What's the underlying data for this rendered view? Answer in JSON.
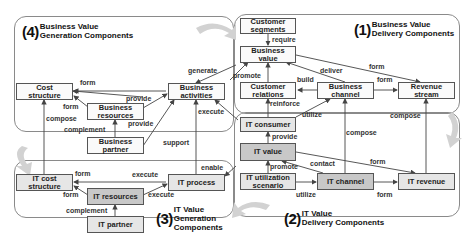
{
  "panels": {
    "p4": {
      "num": "(4)",
      "line1": "Business Value",
      "line2": "Generation Components"
    },
    "p1": {
      "num": "(1)",
      "line1": "Business Value",
      "line2": "Delivery Components"
    },
    "p3": {
      "num": "(3)",
      "line1": "IT Value",
      "line2": "Generation",
      "line3": "Components"
    },
    "p2": {
      "num": "(2)",
      "line1": "IT Value",
      "line2": "Delivery Components"
    }
  },
  "nodes": {
    "cost_structure": {
      "line1": "Cost",
      "line2": "structure"
    },
    "business_resources": {
      "line1": "Business",
      "line2": "resources"
    },
    "business_partner": {
      "line1": "Business",
      "line2": "partner"
    },
    "business_activities": {
      "line1": "Business",
      "line2": "activities"
    },
    "customer_segments": {
      "line1": "Customer",
      "line2": "segments"
    },
    "business_value": {
      "line1": "Business",
      "line2": "value"
    },
    "customer_relations": {
      "line1": "Customer",
      "line2": "relations"
    },
    "business_channel": {
      "line1": "Business",
      "line2": "channel"
    },
    "revenue_stream": {
      "line1": "Revenue",
      "line2": "stream"
    },
    "it_consumer": {
      "line1": "IT consumer"
    },
    "it_value": {
      "line1": "IT value"
    },
    "it_utilization_scenario": {
      "line1": "IT utilization",
      "line2": "scenario"
    },
    "it_channel": {
      "line1": "IT channel"
    },
    "it_revenue": {
      "line1": "IT revenue"
    },
    "it_cost_structure": {
      "line1": "IT cost",
      "line2": "structure"
    },
    "it_resources": {
      "line1": "IT resources"
    },
    "it_process": {
      "line1": "IT process"
    },
    "it_partner": {
      "line1": "IT partner"
    }
  },
  "edge_labels": {
    "generate": "generate",
    "form_cost": "form",
    "provide_res": "provide",
    "form_res_cost": "form",
    "compose_cost": "compose",
    "provide_partner": "provide",
    "complement_biz": "complement",
    "execute_biz": "execute",
    "support": "support",
    "require": "require",
    "promote_bv": "promote",
    "deliver": "deliver",
    "form_bv_rev": "form",
    "build": "build",
    "form_ch_rev": "form",
    "reinforce": "reinforce",
    "utilize_top": "utilize",
    "compose_rev": "compose",
    "compose_ch": "compose",
    "provide_itv": "provide",
    "promote_itu": "promote",
    "contact": "contact",
    "form_itv_rev": "form",
    "utilize_bottom": "utilize",
    "form_itch_rev": "form",
    "enable": "enable",
    "form_itc_1": "form",
    "form_itc_2": "form",
    "execute_itr": "execute",
    "execute_itp": "execute",
    "complement_it": "complement"
  },
  "colors": {
    "it_box_light": "#e6e6e6",
    "it_box_dark": "#c8c8c8",
    "biz_box": "#fafafa",
    "cycle_arrow": "#d4d4d4"
  }
}
